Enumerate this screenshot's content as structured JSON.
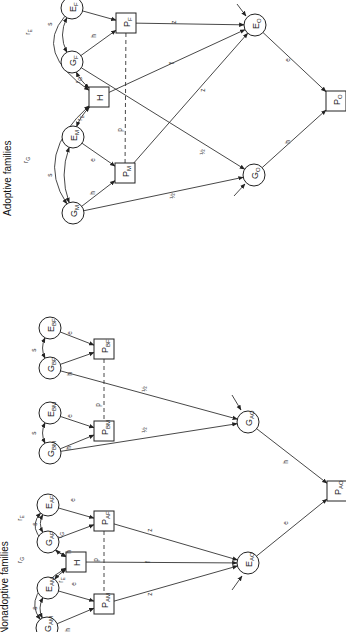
{
  "panels": {
    "adoptive": {
      "title": "Adoptive families",
      "nodes": {
        "EF": {
          "main": "E",
          "sub": "F",
          "shape": "circle"
        },
        "GF": {
          "main": "G",
          "sub": "F",
          "shape": "circle"
        },
        "PF": {
          "main": "P",
          "sub": "F",
          "shape": "box"
        },
        "H": {
          "main": "H",
          "sub": "",
          "shape": "box"
        },
        "EM": {
          "main": "E",
          "sub": "M",
          "shape": "circle"
        },
        "GM": {
          "main": "G",
          "sub": "M",
          "shape": "circle"
        },
        "PM": {
          "main": "P",
          "sub": "M",
          "shape": "box"
        },
        "EO": {
          "main": "E",
          "sub": "O",
          "shape": "circle"
        },
        "GO": {
          "main": "G",
          "sub": "O",
          "shape": "circle"
        },
        "PO": {
          "main": "P",
          "sub": "O",
          "shape": "box"
        }
      },
      "path_labels": {
        "rE_outer": "rE",
        "s_F": "s",
        "h_F": "h",
        "rG_F": "rG",
        "rE_M": "rE",
        "rG_outer": "rG",
        "s_M": "s",
        "e_M": "e",
        "h_M": "h",
        "z_F": "z",
        "f": "f",
        "z_M": "z",
        "p": "p",
        "half_F": "½",
        "half_M": "½",
        "e_O": "e",
        "h_O": "h"
      }
    },
    "nonadoptive": {
      "title": "Nonadoptive families",
      "nodes": {
        "EAF": {
          "main": "E",
          "sub": "AF",
          "shape": "circle"
        },
        "GAF": {
          "main": "G",
          "sub": "AF",
          "shape": "circle"
        },
        "PAF": {
          "main": "P",
          "sub": "AF",
          "shape": "box"
        },
        "H": {
          "main": "H",
          "sub": "",
          "shape": "box"
        },
        "EAM": {
          "main": "E",
          "sub": "AM",
          "shape": "circle"
        },
        "GAM": {
          "main": "G",
          "sub": "AM",
          "shape": "circle"
        },
        "PAM": {
          "main": "P",
          "sub": "AM",
          "shape": "box"
        },
        "EBF": {
          "main": "E",
          "sub": "BF",
          "shape": "circle"
        },
        "GBF": {
          "main": "G",
          "sub": "BF",
          "shape": "circle"
        },
        "PBF": {
          "main": "P",
          "sub": "BF",
          "shape": "box"
        },
        "EBM": {
          "main": "E",
          "sub": "BM",
          "shape": "circle"
        },
        "GBM": {
          "main": "G",
          "sub": "BM",
          "shape": "circle"
        },
        "PBM": {
          "main": "P",
          "sub": "BM",
          "shape": "box"
        },
        "EAO": {
          "main": "E",
          "sub": "AO",
          "shape": "circle"
        },
        "GAO": {
          "main": "G",
          "sub": "AO",
          "shape": "circle"
        },
        "PAO": {
          "main": "P",
          "sub": "AO",
          "shape": "box"
        }
      },
      "path_labels": {
        "rE_outer": "rE",
        "rG_outer": "rG",
        "s_AF": "s",
        "s_AM": "s",
        "e_AF": "e",
        "h_AF": "h",
        "e_AM": "e",
        "h_AM": "h",
        "rG_AF": "rG",
        "rE_AM": "rE",
        "p_A": "p",
        "s_BF": "s",
        "e_BF": "e",
        "h_BF": "h",
        "s_BM": "s",
        "e_BM": "e",
        "h_BM": "h",
        "p_B": "p",
        "z_AF": "z",
        "f": "f",
        "z_AM": "z",
        "half_BF": "½",
        "half_BM": "½",
        "h_O": "h",
        "e_O": "e"
      }
    }
  }
}
